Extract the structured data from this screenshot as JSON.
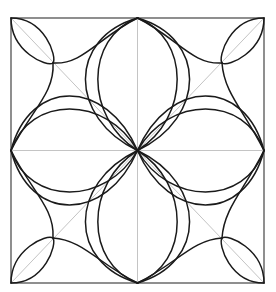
{
  "diagram": {
    "title": "",
    "type": "geometric-rosette",
    "frame": {
      "x": 11,
      "y": 18,
      "width": 253,
      "height": 265
    },
    "center": {
      "x": 137.5,
      "y": 150.5
    },
    "colors": {
      "curve": "#1a1a1a",
      "guide": "#c4c4c4",
      "frame": "#333333",
      "background": "#ffffff"
    },
    "petals": {
      "count": 4,
      "orientation": [
        "up",
        "down",
        "left",
        "right"
      ],
      "curves_per_side": 2,
      "outer_half_width_ratio": 0.21,
      "inner_half_width_ratio": 0.16
    },
    "corner_lenses": {
      "count": 4,
      "tip_offset": 42
    },
    "concave_arcs": {
      "count": 8
    },
    "guides": [
      "diagonal-tl-br",
      "diagonal-tr-bl",
      "vertical-midline",
      "horizontal-midline"
    ]
  }
}
